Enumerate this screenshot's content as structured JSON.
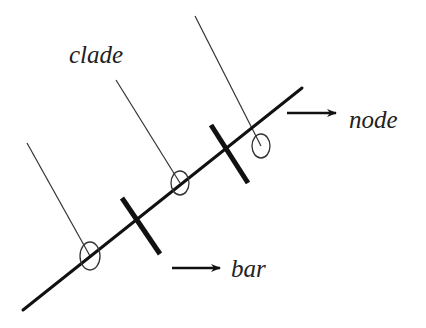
{
  "diagram": {
    "type": "cladogram-terminology",
    "labels": {
      "clade": "clade",
      "node": "node",
      "bar": "bar"
    },
    "colors": {
      "background": "#ffffff",
      "stroke": "#111111",
      "thin_stroke": "#333333",
      "text": "#222222"
    },
    "elements": {
      "main_axis": {
        "x1": 23,
        "y1": 310,
        "x2": 302,
        "y2": 88
      },
      "branches": [
        {
          "name": "branch-1",
          "x1": 27,
          "y1": 143,
          "x2": 90,
          "y2": 256
        },
        {
          "name": "branch-2",
          "x1": 116,
          "y1": 80,
          "x2": 180,
          "y2": 183
        },
        {
          "name": "branch-3",
          "x1": 195,
          "y1": 16,
          "x2": 261,
          "y2": 146
        }
      ],
      "nodes": [
        {
          "name": "node-1",
          "cx": 90,
          "cy": 256,
          "rx": 10,
          "ry": 14
        },
        {
          "name": "node-2",
          "cx": 180,
          "cy": 183,
          "rx": 9,
          "ry": 12
        },
        {
          "name": "node-3",
          "cx": 261,
          "cy": 146,
          "rx": 9,
          "ry": 12
        }
      ],
      "bars": [
        {
          "name": "bar-1",
          "x1": 122,
          "y1": 198,
          "x2": 160,
          "y2": 254
        },
        {
          "name": "bar-2",
          "x1": 211,
          "y1": 125,
          "x2": 248,
          "y2": 183
        }
      ],
      "arrows": [
        {
          "name": "node-arrow",
          "x1": 287,
          "y1": 113,
          "x2": 336,
          "y2": 113
        },
        {
          "name": "bar-arrow",
          "x1": 172,
          "y1": 268,
          "x2": 220,
          "y2": 268
        }
      ]
    }
  }
}
